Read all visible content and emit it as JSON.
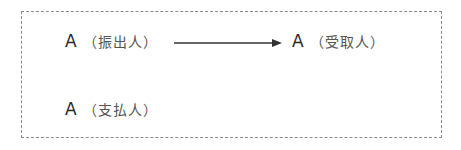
{
  "diagram": {
    "drawer": {
      "letter": "A",
      "role": "（振出人）"
    },
    "payee": {
      "letter": "A",
      "role": "（受取人）"
    },
    "payer": {
      "letter": "A",
      "role": "（支払人）"
    },
    "arrow": {
      "from": "drawer",
      "to": "payee",
      "color": "#333333"
    },
    "frame": {
      "style": "dashed",
      "color": "#8a8a8a"
    }
  }
}
